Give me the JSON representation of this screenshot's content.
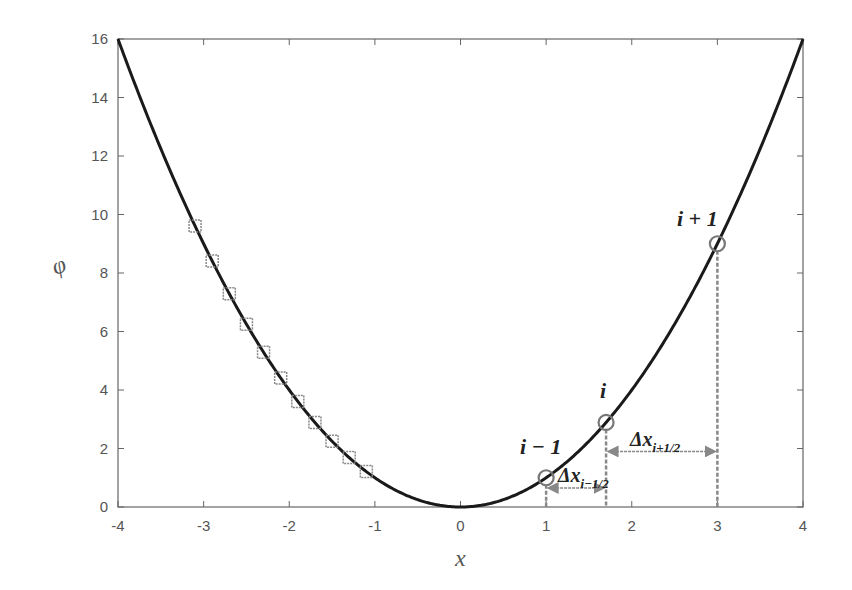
{
  "chart_data": {
    "type": "line",
    "title": "",
    "xlabel": "x",
    "ylabel": "φ",
    "xlim": [
      -4,
      4
    ],
    "ylim": [
      0,
      16
    ],
    "grid": false,
    "x_ticks": [
      -4,
      -3,
      -2,
      -1,
      0,
      1,
      2,
      3,
      4
    ],
    "y_ticks": [
      0,
      2,
      4,
      6,
      8,
      10,
      12,
      14,
      16
    ],
    "series": [
      {
        "name": "phi = x^2",
        "style": "solid black line",
        "function": "x^2",
        "x": [
          -4,
          -3.5,
          -3,
          -2.5,
          -2,
          -1.5,
          -1,
          -0.5,
          0,
          0.5,
          1,
          1.5,
          2,
          2.5,
          3,
          3.5,
          4
        ],
        "values": [
          16,
          12.25,
          9,
          6.25,
          4,
          2.25,
          1,
          0.25,
          0,
          0.25,
          1,
          2.25,
          4,
          6.25,
          9,
          12.25,
          16
        ]
      },
      {
        "name": "uniform grid points",
        "style": "gray square markers",
        "x": [
          -3.1,
          -2.9,
          -2.7,
          -2.5,
          -2.3,
          -2.1,
          -1.9,
          -1.7,
          -1.5,
          -1.3,
          -1.1
        ],
        "values": [
          9.61,
          8.41,
          7.29,
          6.25,
          5.29,
          4.41,
          3.61,
          2.89,
          2.25,
          1.69,
          1.21
        ]
      },
      {
        "name": "non-uniform grid points",
        "style": "gray circle markers",
        "x": [
          1.0,
          1.7,
          3.0
        ],
        "values": [
          1.0,
          2.89,
          9.0
        ],
        "labels": [
          "i − 1",
          "i",
          "i + 1"
        ]
      }
    ],
    "annotations": [
      {
        "text": "i − 1",
        "x": 1.0,
        "y": 1.0
      },
      {
        "text": "i",
        "x": 1.7,
        "y": 2.89
      },
      {
        "text": "i + 1",
        "x": 3.0,
        "y": 9.0
      },
      {
        "text": "Δx_{i−1/2}",
        "from_x": 1.0,
        "to_x": 1.7,
        "y": 0.65,
        "type": "double-arrow"
      },
      {
        "text": "Δx_{i+1/2}",
        "from_x": 1.7,
        "to_x": 3.0,
        "y": 1.9,
        "type": "double-arrow"
      },
      {
        "type": "dashed-vertical",
        "x": 1.0,
        "y_top": 1.0
      },
      {
        "type": "dashed-vertical",
        "x": 1.7,
        "y_top": 2.89
      },
      {
        "type": "dashed-vertical",
        "x": 3.0,
        "y_top": 9.0
      }
    ]
  },
  "labels": {
    "xlabel": "x",
    "ylabel": "φ",
    "ann_im1": "i − 1",
    "ann_i": "i",
    "ann_ip1": "i + 1",
    "dx_minus_main": "Δx",
    "dx_minus_sub": "i−1/2",
    "dx_plus_main": "Δx",
    "dx_plus_sub": "i+1/2"
  }
}
